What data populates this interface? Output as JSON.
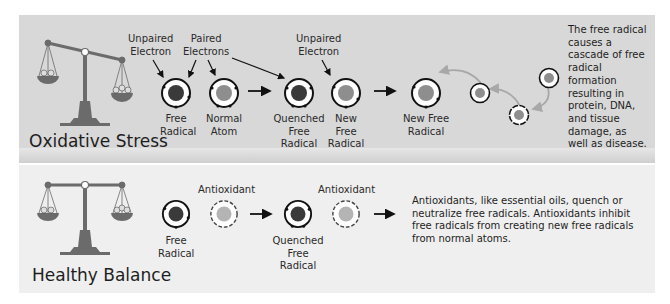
{
  "oxidative_stress": {
    "title": "Oxidative Stress",
    "callouts": {
      "unpaired_electron_1": "Unpaired\nElectron",
      "paired_electrons": "Paired\nElectrons",
      "unpaired_electron_2": "Unpaired\nElectron"
    },
    "atoms": [
      {
        "label": "Free\nRadical",
        "type": "free-radical"
      },
      {
        "label": "Normal\nAtom",
        "type": "normal-atom"
      },
      {
        "label": "Quenched\nFree\nRadical",
        "type": "quenched-free-radical"
      },
      {
        "label": "New\nFree\nRadical",
        "type": "new-free-radical"
      },
      {
        "label": "New Free\nRadical",
        "type": "new-free-radical"
      }
    ],
    "description": "The free radical causes a cascade of free radical formation resulting in protein, DNA, and tissue damage, as well as disease."
  },
  "healthy_balance": {
    "title": "Healthy Balance",
    "atoms": [
      {
        "label": "Free\nRadical",
        "type": "free-radical"
      },
      {
        "label": "Antioxidant",
        "type": "antioxidant"
      },
      {
        "label": "Quenched\nFree\nRadical",
        "type": "quenched-free-radical"
      },
      {
        "label": "Antioxidant",
        "type": "antioxidant"
      }
    ],
    "description": "Antioxidants, like essential oils, quench or neutralize free radicals. Antioxidants inhibit free radicals from creating new free radicals from normal atoms."
  },
  "colors": {
    "panel_top": "#d8d8d8",
    "panel_bottom": "#efefef",
    "scale": "#6b6b6b",
    "free_radical_core": "#3a3a3a",
    "normal_core": "#8e8e8e",
    "antioxidant_core": "#b4b4b4",
    "cascade_arrow": "#a8a8a8"
  }
}
